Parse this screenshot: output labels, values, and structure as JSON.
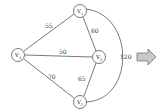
{
  "diagram": {
    "type": "weighted-graph",
    "nodes": [
      {
        "id": "V1",
        "label": "V",
        "subscript": "1",
        "x": 80,
        "y": 11
      },
      {
        "id": "V2",
        "label": "V",
        "subscript": "2",
        "x": 99,
        "y": 57
      },
      {
        "id": "V3",
        "label": "V",
        "subscript": "3",
        "x": 80,
        "y": 101
      },
      {
        "id": "V4",
        "label": "V",
        "subscript": "4",
        "x": 18,
        "y": 55
      }
    ],
    "edges": [
      {
        "from": "V4",
        "to": "V1",
        "weight": "55"
      },
      {
        "from": "V1",
        "to": "V2",
        "weight": "60"
      },
      {
        "from": "V4",
        "to": "V2",
        "weight": "50"
      },
      {
        "from": "V4",
        "to": "V3",
        "weight": "70"
      },
      {
        "from": "V2",
        "to": "V3",
        "weight": "65"
      },
      {
        "from": "V1",
        "to": "V3",
        "weight": "120",
        "curved": true
      }
    ],
    "arrow": {
      "direction": "right",
      "color": "#c8c8c8",
      "stroke": "#777777"
    }
  }
}
